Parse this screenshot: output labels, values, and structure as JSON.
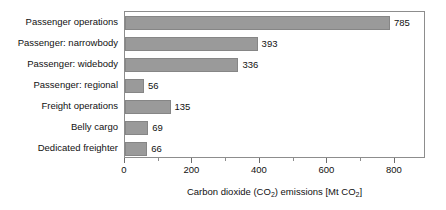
{
  "chart_data": {
    "type": "bar",
    "orientation": "horizontal",
    "title": "",
    "xlabel": "Carbon dioxide (CO2) emissions [Mt CO2]",
    "xlabel_parts": {
      "prefix": "Carbon dioxide (CO",
      "sub1": "2",
      "middle": ") emissions [Mt CO",
      "sub2": "2",
      "suffix": "]"
    },
    "ylabel": "",
    "categories": [
      "Passenger operations",
      "Passenger: narrowbody",
      "Passenger: widebody",
      "Passenger: regional",
      "Freight operations",
      "Belly cargo",
      "Dedicated freighter"
    ],
    "values": [
      785,
      393,
      336,
      56,
      135,
      69,
      66
    ],
    "value_labels": [
      "785",
      "393",
      "336",
      "56",
      "135",
      "69",
      "66"
    ],
    "xlim": [
      0,
      892
    ],
    "xticks": [
      0,
      200,
      400,
      600,
      800
    ],
    "xtick_labels": [
      "0",
      "200",
      "400",
      "600",
      "800"
    ],
    "xminorticks": [
      100,
      300,
      500,
      700
    ],
    "grid": false,
    "legend": false,
    "bar_color": "#9a9a9a",
    "bar_edge_color": "#868686",
    "frame_color": "#8d8d8d",
    "background_color": "#ffffff",
    "text_color": "#111111"
  }
}
